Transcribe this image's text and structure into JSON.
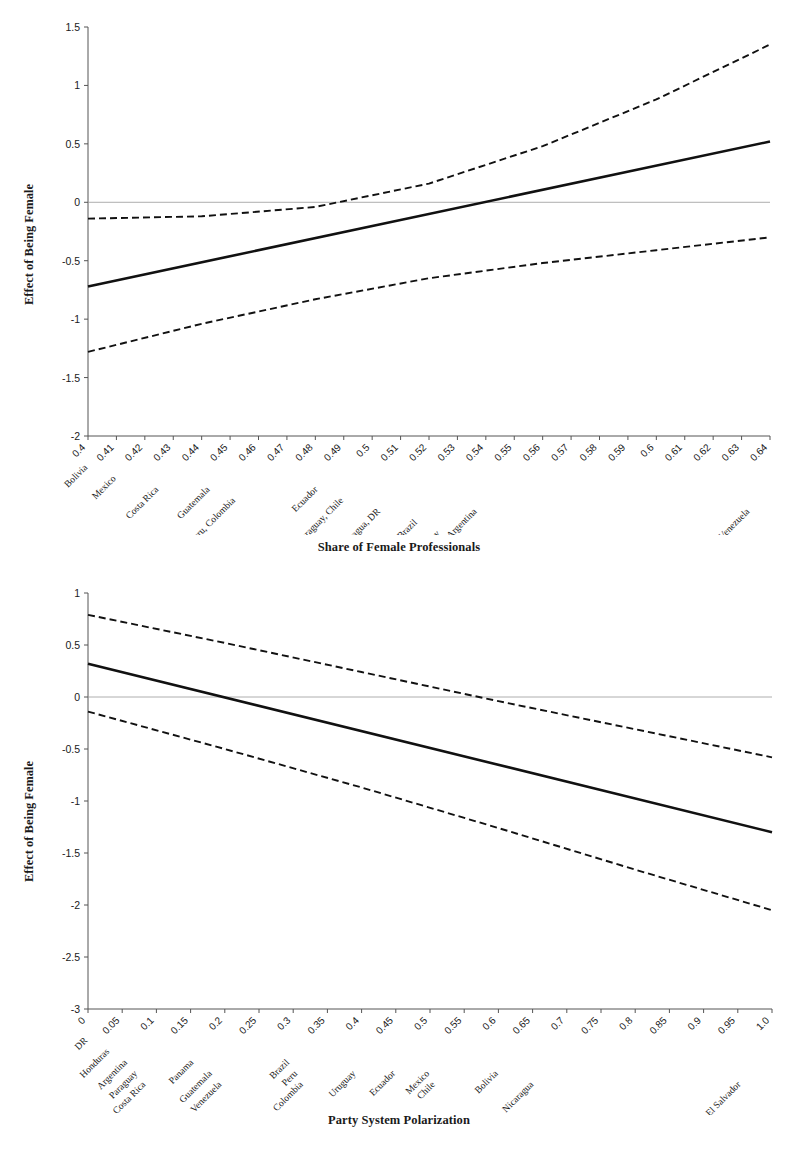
{
  "figure1": {
    "name": "effect-of-being-female-by-share-of-female-professionals",
    "ylabel": "Effect of Being Female",
    "xlabel": "Share of Female Professionals"
  },
  "figure2": {
    "name": "effect-of-being-female-by-party-system-polarization",
    "ylabel": "Effect of Being Female",
    "xlabel": "Party System Polarization"
  },
  "chart_data": [
    {
      "type": "line",
      "title": "",
      "xlabel": "Share of Female Professionals",
      "ylabel": "Effect of Being Female",
      "xlim": [
        0.4,
        0.64
      ],
      "ylim": [
        -2,
        1.5
      ],
      "grid": false,
      "legend": "none",
      "zero_line": true,
      "xticks": [
        "0.4",
        "0.41",
        "0.42",
        "0.43",
        "0.44",
        "0.45",
        "0.46",
        "0.47",
        "0.48",
        "0.49",
        "0.5",
        "0.51",
        "0.52",
        "0.53",
        "0.54",
        "0.55",
        "0.56",
        "0.57",
        "0.58",
        "0.59",
        "0.6",
        "0.61",
        "0.62",
        "0.63",
        "0.64"
      ],
      "xtick_values": [
        0.4,
        0.41,
        0.42,
        0.43,
        0.44,
        0.45,
        0.46,
        0.47,
        0.48,
        0.49,
        0.5,
        0.51,
        0.52,
        0.53,
        0.54,
        0.55,
        0.56,
        0.57,
        0.58,
        0.59,
        0.6,
        0.61,
        0.62,
        0.63,
        0.64
      ],
      "yticks": [
        "1.5",
        "1",
        "0.5",
        "0",
        "-0.5",
        "-1",
        "-1.5",
        "-2"
      ],
      "ytick_values": [
        1.5,
        1,
        0.5,
        0,
        -0.5,
        -1,
        -1.5,
        -2
      ],
      "country_annotations": [
        {
          "label": "Bolivia",
          "x": 0.4,
          "row": 0
        },
        {
          "label": "Mexico",
          "x": 0.41,
          "row": 1
        },
        {
          "label": "Costa Rica",
          "x": 0.425,
          "row": 2
        },
        {
          "label": "Guatemala",
          "x": 0.443,
          "row": 2
        },
        {
          "label": "El Salvador, Peru, Colombia",
          "x": 0.452,
          "row": 3
        },
        {
          "label": "Ecuador",
          "x": 0.481,
          "row": 2
        },
        {
          "label": "Paraguay, Chile",
          "x": 0.49,
          "row": 3
        },
        {
          "label": "Nicaragua, DR",
          "x": 0.503,
          "row": 4
        },
        {
          "label": "Honduras, Brazil",
          "x": 0.516,
          "row": 5
        },
        {
          "label": "Panama, Uruguay",
          "x": 0.524,
          "row": 6
        },
        {
          "label": "Argentina",
          "x": 0.537,
          "row": 4
        },
        {
          "label": "Venezuela",
          "x": 0.633,
          "row": 4
        }
      ],
      "series": [
        {
          "name": "Marginal effect (point estimate)",
          "style": "solid",
          "x": [
            0.4,
            0.64
          ],
          "values": [
            -0.72,
            0.52
          ]
        },
        {
          "name": "Upper 95% confidence bound",
          "style": "dashed",
          "x": [
            0.4,
            0.44,
            0.48,
            0.52,
            0.56,
            0.6,
            0.64
          ],
          "values": [
            -0.14,
            -0.12,
            -0.04,
            0.16,
            0.48,
            0.88,
            1.35
          ]
        },
        {
          "name": "Lower 95% confidence bound",
          "style": "dashed",
          "x": [
            0.4,
            0.44,
            0.48,
            0.52,
            0.56,
            0.6,
            0.64
          ],
          "values": [
            -1.28,
            -1.04,
            -0.83,
            -0.65,
            -0.52,
            -0.41,
            -0.3
          ]
        }
      ]
    },
    {
      "type": "line",
      "title": "",
      "xlabel": "Party System Polarization",
      "ylabel": "Effect of Being Female",
      "xlim": [
        0,
        1.0
      ],
      "ylim": [
        -3,
        1
      ],
      "grid": false,
      "legend": "none",
      "zero_line": true,
      "xticks": [
        "0",
        "0.05",
        "0.1",
        "0.15",
        "0.2",
        "0.25",
        "0.3",
        "0.35",
        "0.4",
        "0.45",
        "0.5",
        "0.55",
        "0.6",
        "0.65",
        "0.7",
        "0.75",
        "0.8",
        "0.85",
        "0.9",
        "0.95",
        "1.0"
      ],
      "xtick_values": [
        0,
        0.05,
        0.1,
        0.15,
        0.2,
        0.25,
        0.3,
        0.35,
        0.4,
        0.45,
        0.5,
        0.55,
        0.6,
        0.65,
        0.7,
        0.75,
        0.8,
        0.85,
        0.9,
        0.95,
        1.0
      ],
      "yticks": [
        "1",
        "0.5",
        "0",
        "-0.5",
        "-1",
        "-1.5",
        "-2",
        "-2.5",
        "-3"
      ],
      "ytick_values": [
        1,
        0.5,
        0,
        -0.5,
        -1,
        -1.5,
        -2,
        -2.5,
        -3
      ],
      "country_annotations": [
        {
          "label": "DR",
          "x": 0.0,
          "row": 0
        },
        {
          "label": "Honduras",
          "x": 0.032,
          "row": 1
        },
        {
          "label": "Argentina",
          "x": 0.058,
          "row": 2
        },
        {
          "label": "Paraguay",
          "x": 0.073,
          "row": 3
        },
        {
          "label": "Costa Rica",
          "x": 0.085,
          "row": 4
        },
        {
          "label": "Panama",
          "x": 0.155,
          "row": 2
        },
        {
          "label": "Guatemala",
          "x": 0.182,
          "row": 3
        },
        {
          "label": "Venezuela",
          "x": 0.196,
          "row": 4
        },
        {
          "label": "Brazil",
          "x": 0.295,
          "row": 2
        },
        {
          "label": "Peru",
          "x": 0.307,
          "row": 3
        },
        {
          "label": "Colombia",
          "x": 0.315,
          "row": 4
        },
        {
          "label": "Uruguay",
          "x": 0.392,
          "row": 3
        },
        {
          "label": "Ecuador",
          "x": 0.45,
          "row": 3
        },
        {
          "label": "Mexico",
          "x": 0.5,
          "row": 3
        },
        {
          "label": "Chile",
          "x": 0.508,
          "row": 4
        },
        {
          "label": "Bolivia",
          "x": 0.6,
          "row": 3
        },
        {
          "label": "Nicaragua",
          "x": 0.652,
          "row": 4
        },
        {
          "label": "El Salvador",
          "x": 0.955,
          "row": 4
        }
      ],
      "series": [
        {
          "name": "Marginal effect (point estimate)",
          "style": "solid",
          "x": [
            0,
            1.0
          ],
          "values": [
            0.32,
            -1.3
          ]
        },
        {
          "name": "Upper 95% confidence bound",
          "style": "dashed",
          "x": [
            0,
            0.2,
            0.4,
            0.6,
            0.8,
            1.0
          ],
          "values": [
            0.79,
            0.52,
            0.24,
            -0.04,
            -0.31,
            -0.58
          ]
        },
        {
          "name": "Lower 95% confidence bound",
          "style": "dashed",
          "x": [
            0,
            0.2,
            0.4,
            0.6,
            0.8,
            1.0
          ],
          "values": [
            -0.14,
            -0.5,
            -0.87,
            -1.26,
            -1.66,
            -2.05
          ]
        }
      ]
    }
  ]
}
